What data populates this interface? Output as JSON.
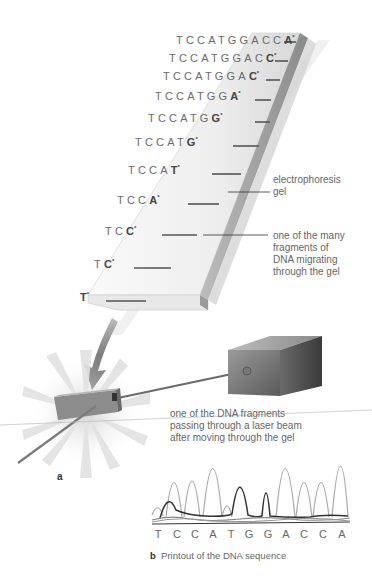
{
  "figure": {
    "panel_a_label": "a",
    "panel_b_label": "b",
    "panel_b_caption": "Printout of the DNA sequence"
  },
  "sequences": [
    {
      "prefix": "TCCATGGACC",
      "last": "A",
      "mark": "*"
    },
    {
      "prefix": "TCCATGGAC",
      "last": "C",
      "mark": "*"
    },
    {
      "prefix": "TCCATGGA",
      "last": "C",
      "mark": "*"
    },
    {
      "prefix": "TCCATGG",
      "last": "A",
      "mark": "*"
    },
    {
      "prefix": "TCCATG",
      "last": "G",
      "mark": "*"
    },
    {
      "prefix": "TCCAT",
      "last": "G",
      "mark": "*"
    },
    {
      "prefix": "TCCA",
      "last": "T",
      "mark": "*"
    },
    {
      "prefix": "TCC",
      "last": "A",
      "mark": "*"
    },
    {
      "prefix": "TC",
      "last": "C",
      "mark": "*"
    },
    {
      "prefix": "T",
      "last": "C",
      "mark": "*"
    },
    {
      "prefix": "",
      "last": "T",
      "mark": "*"
    }
  ],
  "callouts": {
    "gel": "electrophoresis\ngel",
    "fragment": "one of the many\nfragments of\nDNA migrating\nthrough the gel",
    "laser": "one of the DNA fragments\npassing through a laser beam\nafter moving through the gel"
  },
  "printout": {
    "bases": [
      "T",
      "C",
      "C",
      "A",
      "T",
      "G",
      "G",
      "A",
      "C",
      "C",
      "A"
    ]
  },
  "colors": {
    "text": "#666666",
    "gel_light": "#f2f2f2",
    "gel_shadow": "#9a9a9a",
    "band": "#555555",
    "detector": "#5a5a5a",
    "laser": "#777777",
    "starburst": "#dcdcdc"
  }
}
